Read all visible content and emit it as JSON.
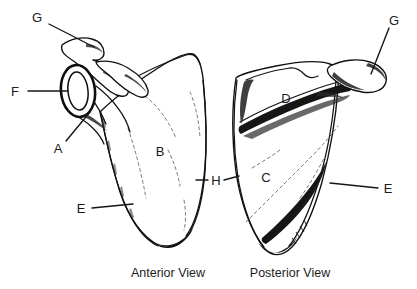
{
  "figure": {
    "background_color": "#ffffff",
    "ink_color": "#111111",
    "width": 417,
    "height": 289
  },
  "captions": {
    "anterior": "Anterior View",
    "posterior": "Posterior View"
  },
  "labels": {
    "g_left": "G",
    "f_left": "F",
    "a_left": "A",
    "b_left": "B",
    "e_left": "E",
    "h_middle": "H",
    "g_right": "G",
    "d_right": "D",
    "c_right": "C",
    "e_right": "E"
  }
}
